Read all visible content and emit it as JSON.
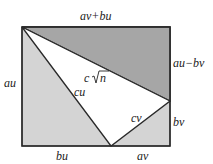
{
  "diagram": {
    "type": "geometric-proof",
    "colors": {
      "dark_region": "#a6a6a6",
      "light_region": "#d4d4d4",
      "center_triangle": "#ffffff",
      "stroke": "#2a2a2a"
    },
    "labels": {
      "top": "av+bu",
      "right_upper": "au−bv",
      "right_lower": "bv",
      "left": "au",
      "bottom_left": "bu",
      "bottom_right": "av",
      "hypotenuse": "c",
      "hypotenuse_sqrt": "n",
      "leg_long": "cu",
      "leg_short": "cv"
    }
  }
}
